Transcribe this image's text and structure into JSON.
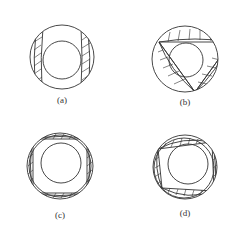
{
  "figures": [
    {
      "id": "a",
      "label": "(a)",
      "shape": "two-vertical-bands"
    },
    {
      "id": "b",
      "label": "(b)",
      "shape": "triangle"
    },
    {
      "id": "c",
      "label": "(c)",
      "shape": "square"
    },
    {
      "id": "d",
      "label": "(d)",
      "shape": "trapezoid"
    }
  ],
  "colors": {
    "line": "#333333",
    "background": "#ffffff"
  }
}
